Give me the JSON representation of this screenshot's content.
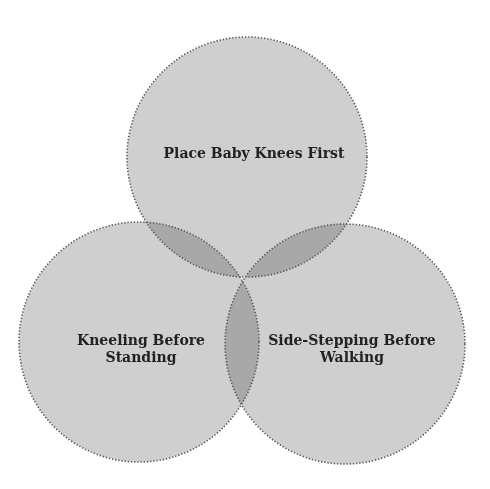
{
  "diagram": {
    "type": "venn",
    "colors": {
      "background": "#ffffff",
      "circle_fill": "#cfcfcf",
      "border": "#555555",
      "text": "#222222"
    },
    "sets": [
      {
        "id": "top",
        "label_lines": [
          "Place Baby Knees First"
        ],
        "cx": 247,
        "cy": 157,
        "r": 120
      },
      {
        "id": "left",
        "label_lines": [
          "Kneeling Before",
          "Standing"
        ],
        "cx": 139,
        "cy": 342,
        "r": 120
      },
      {
        "id": "right",
        "label_lines": [
          "Side-Stepping Before",
          "Walking"
        ],
        "cx": 345,
        "cy": 344,
        "r": 120
      }
    ]
  }
}
